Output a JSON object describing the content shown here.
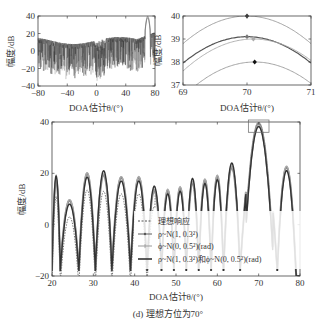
{
  "caption": "(d) 理想方位为70°",
  "chart_data": [
    {
      "id": "top-left",
      "type": "line",
      "title": "",
      "xlabel": "DOA估计θ/(°)",
      "ylabel": "幅度/dB",
      "xlim": [
        -80,
        80
      ],
      "ylim": [
        -40,
        40
      ],
      "xticks": [
        "-80",
        "-40",
        "0",
        "40",
        "80"
      ],
      "yticks": [
        "40",
        "20",
        "0",
        "-20",
        "-40"
      ],
      "description": "Dense noisy beam patterns over full angular range; sidelobes mostly between -20 and 20 dB with deep nulls near -35 dB around 0°; main peak ~40 dB at 70°",
      "peak": {
        "x": 70,
        "y": 40
      },
      "grid": false
    },
    {
      "id": "top-right-zoom",
      "type": "line",
      "xlabel": "DOA估计θ/(°)",
      "ylabel": "幅度/dB",
      "xlim": [
        69,
        71
      ],
      "ylim": [
        37,
        40
      ],
      "xticks": [
        "69",
        "70",
        "71"
      ],
      "yticks": [
        "40",
        "39",
        "38",
        "37"
      ],
      "grid": false,
      "series": [
        {
          "name": "理想响应",
          "peak_x": 70.0,
          "peak_y": 40.0,
          "edge_y": 38.8,
          "marker": "diamond-dark",
          "color": "#9a9a9a"
        },
        {
          "name": "ρ~N(1, 0.3²)",
          "peak_x": 70.0,
          "peak_y": 39.1,
          "edge_y": 37.95,
          "marker": "diamond-gray",
          "color": "#555555"
        },
        {
          "name": "ϕ~N(0, 0.5²)(rad)",
          "peak_x": 70.1,
          "peak_y": 39.0,
          "edge_y": 37.85,
          "marker": "diamond-light",
          "color": "#aaaaaa"
        },
        {
          "name": "ρ~N(1, 0.3²)和ϕ~N(0, 0.5²)(rad)",
          "peak_x": 70.12,
          "peak_y": 38.0,
          "edge_y": 36.8,
          "marker": "diamond-black",
          "color": "#9a9a9a"
        }
      ]
    },
    {
      "id": "main",
      "type": "line",
      "xlabel": "DOA估计θ/(°)",
      "ylabel": "幅度/dB",
      "xlim": [
        20,
        80
      ],
      "ylim": [
        -20,
        40
      ],
      "xticks": [
        "20",
        "30",
        "40",
        "50",
        "60",
        "70",
        "80"
      ],
      "yticks": [
        "40",
        "20",
        "0",
        "-20"
      ],
      "grid": false,
      "legend_position": "lower-center",
      "highlight_box": {
        "x": [
          67.5,
          72.5
        ],
        "y": [
          36,
          40
        ]
      },
      "series": [
        {
          "name": "理想响应",
          "style": "dashed",
          "color": "#555555"
        },
        {
          "name": "ρ~N(1, 0.3²)",
          "style": "solid-marker",
          "color": "#777777"
        },
        {
          "name": "ϕ~N(0, 0.5²)(rad)",
          "style": "solid-light",
          "color": "#999999"
        },
        {
          "name": "ρ~N(1, 0.3²)和ϕ~N(0, 0.5²)(rad)",
          "style": "solid-thick",
          "color": "#333333"
        }
      ],
      "lobes": [
        {
          "x": 20.5,
          "y": 17
        },
        {
          "x": 25,
          "y": 9
        },
        {
          "x": 28.5,
          "y": 19.5
        },
        {
          "x": 32.5,
          "y": 19
        },
        {
          "x": 37,
          "y": 18
        },
        {
          "x": 41,
          "y": 18
        },
        {
          "x": 45,
          "y": 13
        },
        {
          "x": 48,
          "y": 13
        },
        {
          "x": 51,
          "y": 14
        },
        {
          "x": 54,
          "y": 16
        },
        {
          "x": 57,
          "y": 17
        },
        {
          "x": 60,
          "y": 18.5
        },
        {
          "x": 63,
          "y": 22
        },
        {
          "x": 70,
          "y": 40
        },
        {
          "x": 76.5,
          "y": 22
        }
      ],
      "nulls": [
        22,
        26.5,
        30.5,
        34.5,
        39,
        43,
        46.5,
        49.5,
        52.5,
        55.5,
        58.5,
        61.5,
        65.5,
        74.5,
        79
      ]
    }
  ]
}
